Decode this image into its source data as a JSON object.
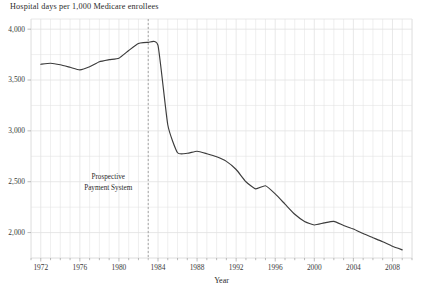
{
  "chart_data": {
    "type": "line",
    "title": "Hospital days per 1,000 Medicare enrollees",
    "xlabel": "Year",
    "ylabel": "",
    "xlim": [
      1971,
      2010
    ],
    "ylim": [
      1750,
      4100
    ],
    "grid": true,
    "legend_position": "none",
    "y_ticks": [
      "4,000",
      "3,500",
      "3,000",
      "2,500",
      "2,000"
    ],
    "y_tick_values": [
      4000,
      3500,
      3000,
      2500,
      2000
    ],
    "y_minor_step": 250,
    "x_ticks": [
      "1972",
      "1976",
      "1980",
      "1984",
      "1988",
      "1992",
      "1996",
      "2000",
      "2004",
      "2008"
    ],
    "x_tick_values": [
      1972,
      1976,
      1980,
      1984,
      1988,
      1992,
      1996,
      2000,
      2004,
      2008
    ],
    "x_minor_step": 1,
    "line_color": "#3c3c3c",
    "grid_color": "#e2e2e2",
    "annotations": [
      {
        "name": "prospective-payment-system",
        "line1": "Prospective",
        "line2": "Payment System",
        "x_value": 1983,
        "style": "dashed-vertical",
        "color": "#9a9a9a"
      }
    ],
    "series": [
      {
        "name": "Hospital days per 1,000 Medicare enrollees",
        "x": [
          1972,
          1973,
          1974,
          1975,
          1976,
          1977,
          1978,
          1979,
          1980,
          1981,
          1982,
          1983,
          1984,
          1985,
          1986,
          1987,
          1988,
          1989,
          1990,
          1991,
          1992,
          1993,
          1994,
          1995,
          1996,
          1997,
          1998,
          1999,
          2000,
          2001,
          2002,
          2003,
          2004,
          2005,
          2006,
          2007,
          2008,
          2009
        ],
        "values": [
          3655,
          3665,
          3650,
          3625,
          3600,
          3630,
          3680,
          3700,
          3715,
          3790,
          3860,
          3870,
          3840,
          3060,
          2785,
          2780,
          2800,
          2775,
          2745,
          2700,
          2620,
          2500,
          2430,
          2460,
          2380,
          2280,
          2180,
          2110,
          2075,
          2095,
          2110,
          2070,
          2035,
          1990,
          1950,
          1910,
          1865,
          1830
        ]
      }
    ]
  }
}
